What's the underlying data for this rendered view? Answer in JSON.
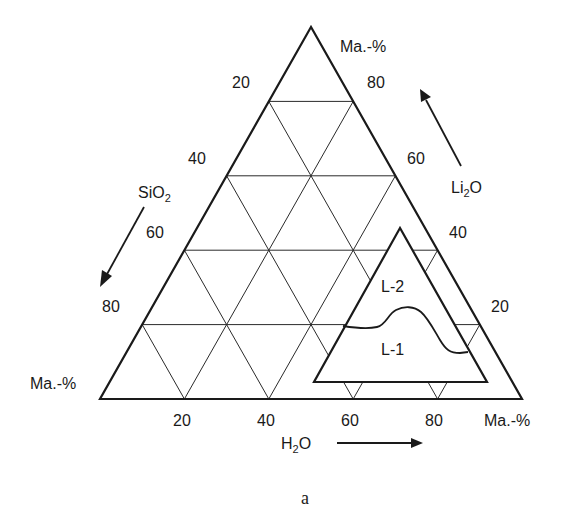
{
  "diagram": {
    "type": "ternary",
    "caption": "a",
    "corner_labels": {
      "top": "Ma.-%",
      "bottom_left": "Ma.-%",
      "bottom_right": "Ma.-%"
    },
    "axes": {
      "left": {
        "component": "SiO",
        "subscript": "2",
        "ticks": [
          "20",
          "40",
          "60",
          "80"
        ],
        "arrow_direction": "down-left"
      },
      "right": {
        "component": "Li",
        "subscript": "2",
        "component_suffix": "O",
        "ticks": [
          "80",
          "60",
          "40",
          "20"
        ],
        "arrow_direction": "up-left"
      },
      "bottom": {
        "component": "H",
        "subscript": "2",
        "component_suffix": "O",
        "ticks": [
          "20",
          "40",
          "60",
          "80"
        ],
        "arrow_direction": "right"
      }
    },
    "regions": [
      {
        "label": "L-2"
      },
      {
        "label": "L-1"
      }
    ],
    "grid_step_percent": 20,
    "colors": {
      "line": "#1a1a1a",
      "background": "#ffffff"
    }
  }
}
